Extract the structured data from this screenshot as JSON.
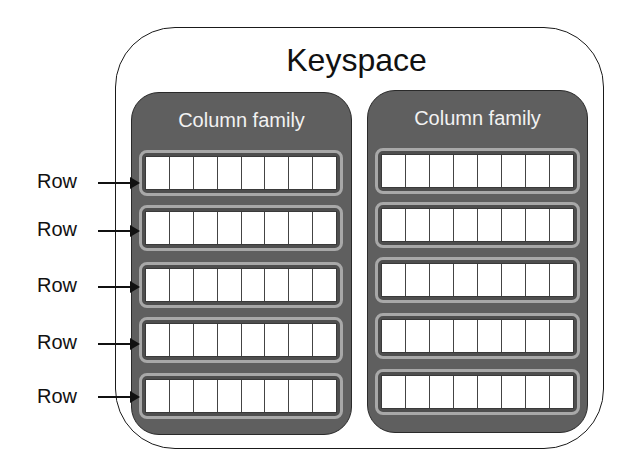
{
  "diagram": {
    "keyspace": {
      "label": "Keyspace"
    },
    "column_families": [
      {
        "label": "Column family",
        "rows": 5,
        "cells_per_row": 8
      },
      {
        "label": "Column family",
        "rows": 5,
        "cells_per_row": 8
      }
    ],
    "row_labels": [
      "Row",
      "Row",
      "Row",
      "Row",
      "Row"
    ],
    "colors": {
      "column_family_fill": "#5f5f5f",
      "row_border": "#a8a8a8",
      "cell_fill": "#ffffff",
      "outline": "#1a1a1a"
    }
  }
}
